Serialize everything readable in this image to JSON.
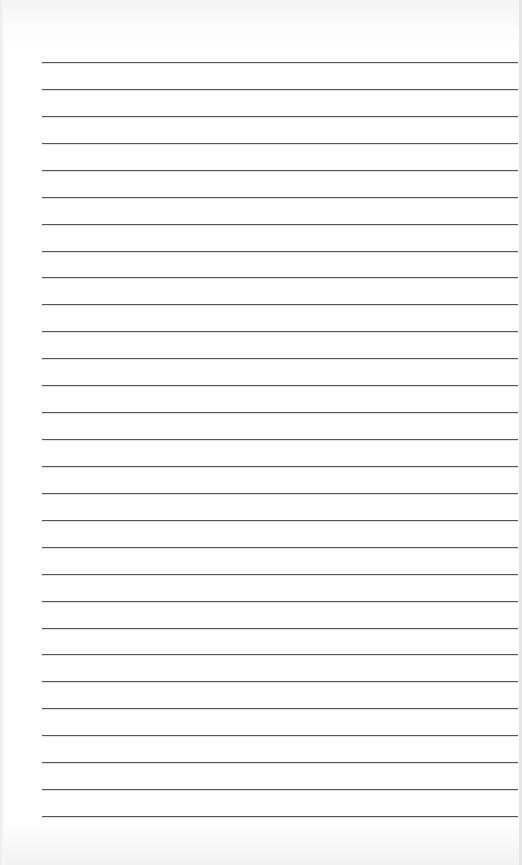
{
  "document": {
    "type": "lined-paper",
    "background_color": "#ffffff",
    "line_color": "#555555",
    "ruled_lines": {
      "count": 29,
      "first_y": 62,
      "spacing": 26.93,
      "left_x": 42,
      "right_x": 518
    }
  }
}
